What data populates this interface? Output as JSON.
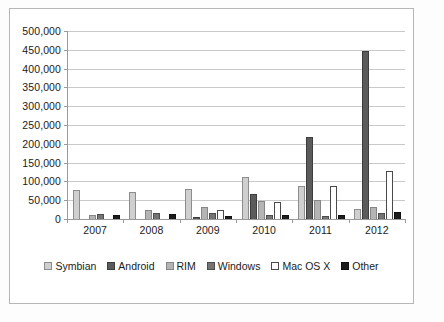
{
  "chart_data": {
    "type": "bar",
    "title": "",
    "subtitle": "",
    "xlabel": "",
    "ylabel": "",
    "categories": [
      "2007",
      "2008",
      "2009",
      "2010",
      "2011",
      "2012"
    ],
    "ylim": [
      0,
      500000
    ],
    "ytick_step": 50000,
    "ytick_labels": [
      "500,000",
      "450,000",
      "400,000",
      "350,000",
      "300,000",
      "250,000",
      "200,000",
      "150,000",
      "100,000",
      "50,000",
      "0"
    ],
    "ytick_values": [
      500000,
      450000,
      400000,
      350000,
      300000,
      250000,
      200000,
      150000,
      100000,
      50000,
      0
    ],
    "grid": true,
    "grid_axis": "y",
    "legend_position": "bottom",
    "series": [
      {
        "name": "Symbian",
        "key": "symbian",
        "color": "#cfcfcf",
        "values": [
          77000,
          72000,
          80000,
          111000,
          87000,
          27000
        ]
      },
      {
        "name": "Android",
        "key": "android",
        "color": "#5b5b5b",
        "values": [
          0,
          0,
          4500,
          66000,
          218000,
          446000
        ]
      },
      {
        "name": "RIM",
        "key": "rim",
        "color": "#b4b4b4",
        "values": [
          11000,
          23000,
          33000,
          47000,
          50000,
          33000
        ]
      },
      {
        "name": "Windows",
        "key": "windows",
        "color": "#747474",
        "values": [
          14000,
          16000,
          15000,
          12000,
          9000,
          16000
        ]
      },
      {
        "name": "Mac OS X",
        "key": "macosx",
        "color": "#ffffff",
        "values": [
          0,
          0,
          24000,
          46000,
          87000,
          128000
        ]
      },
      {
        "name": "Other",
        "key": "other",
        "color": "#1c1c1c",
        "values": [
          12000,
          13000,
          8500,
          11000,
          12000,
          18000
        ]
      }
    ]
  },
  "legend": {
    "items": [
      {
        "label": "Symbian",
        "key": "symbian"
      },
      {
        "label": "Android",
        "key": "android"
      },
      {
        "label": "RIM",
        "key": "rim"
      },
      {
        "label": "Windows",
        "key": "windows"
      },
      {
        "label": "Mac OS X",
        "key": "macosx"
      },
      {
        "label": "Other",
        "key": "other"
      }
    ]
  }
}
